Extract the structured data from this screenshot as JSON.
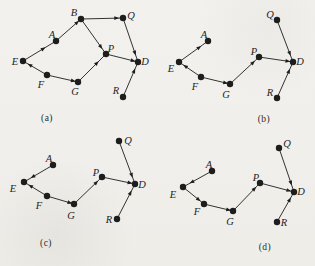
{
  "figure": {
    "background_color": "#f1f0ec",
    "ink_color": "#1d1d1d",
    "node_ids": [
      "A",
      "B",
      "D",
      "E",
      "F",
      "G",
      "P",
      "Q",
      "R"
    ],
    "panels": [
      {
        "id": "a",
        "caption": "(a)",
        "caption_x": 47,
        "caption_y": 121,
        "nodes": [
          {
            "id": "E",
            "x": 23,
            "y": 61,
            "label_x": 15,
            "label_y": 65
          },
          {
            "id": "A",
            "x": 56,
            "y": 41,
            "label_x": 52,
            "label_y": 38
          },
          {
            "id": "B",
            "x": 81,
            "y": 19,
            "label_x": 74,
            "label_y": 16
          },
          {
            "id": "Q",
            "x": 123,
            "y": 18,
            "label_x": 131,
            "label_y": 19
          },
          {
            "id": "P",
            "x": 106,
            "y": 54,
            "label_x": 111,
            "label_y": 52
          },
          {
            "id": "D",
            "x": 138,
            "y": 62,
            "label_x": 145,
            "label_y": 65
          },
          {
            "id": "F",
            "x": 47,
            "y": 75,
            "label_x": 41,
            "label_y": 88
          },
          {
            "id": "G",
            "x": 78,
            "y": 82,
            "label_x": 75,
            "label_y": 95
          },
          {
            "id": "R",
            "x": 123,
            "y": 97,
            "label_x": 116,
            "label_y": 94
          }
        ],
        "edges": [
          {
            "from": "E",
            "to": "A",
            "arrow_t": 0.62
          },
          {
            "from": "A",
            "to": "B",
            "arrow_t": 0.85
          },
          {
            "from": "B",
            "to": "Q",
            "arrow_t": 0.85
          },
          {
            "from": "B",
            "to": "P",
            "arrow_t": 0.8
          },
          {
            "from": "F",
            "to": "E",
            "arrow_t": 0.72
          },
          {
            "from": "F",
            "to": "G",
            "arrow_t": 0.85
          },
          {
            "from": "G",
            "to": "P",
            "arrow_t": 0.68
          },
          {
            "from": "P",
            "to": "D",
            "arrow_t": 0.85
          },
          {
            "from": "Q",
            "to": "D",
            "arrow_t": 0.8
          },
          {
            "from": "R",
            "to": "D",
            "arrow_t": 0.75
          }
        ]
      },
      {
        "id": "b",
        "caption": "(b)",
        "caption_x": 264,
        "caption_y": 122,
        "nodes": [
          {
            "id": "Q",
            "x": 277,
            "y": 20,
            "label_x": 270,
            "label_y": 18
          },
          {
            "id": "A",
            "x": 208,
            "y": 41,
            "label_x": 204,
            "label_y": 38
          },
          {
            "id": "E",
            "x": 179,
            "y": 62,
            "label_x": 171,
            "label_y": 72
          },
          {
            "id": "F",
            "x": 201,
            "y": 77,
            "label_x": 195,
            "label_y": 90
          },
          {
            "id": "G",
            "x": 230,
            "y": 84,
            "label_x": 226,
            "label_y": 98
          },
          {
            "id": "P",
            "x": 259,
            "y": 57,
            "label_x": 254,
            "label_y": 55
          },
          {
            "id": "D",
            "x": 293,
            "y": 62,
            "label_x": 300,
            "label_y": 65
          },
          {
            "id": "R",
            "x": 277,
            "y": 98,
            "label_x": 270,
            "label_y": 96
          }
        ],
        "edges": [
          {
            "from": "E",
            "to": "A",
            "arrow_t": 0.7
          },
          {
            "from": "F",
            "to": "E",
            "arrow_t": 0.72
          },
          {
            "from": "F",
            "to": "G",
            "arrow_t": 0.85
          },
          {
            "from": "G",
            "to": "P",
            "arrow_t": 0.8
          },
          {
            "from": "P",
            "to": "D",
            "arrow_t": 0.85
          },
          {
            "from": "Q",
            "to": "D",
            "arrow_t": 0.8
          },
          {
            "from": "R",
            "to": "D",
            "arrow_t": 0.75
          }
        ]
      },
      {
        "id": "c",
        "caption": "(c)",
        "caption_x": 46,
        "caption_y": 246,
        "nodes": [
          {
            "id": "Q",
            "x": 119,
            "y": 141,
            "label_x": 128,
            "label_y": 144
          },
          {
            "id": "A",
            "x": 53,
            "y": 165,
            "label_x": 49,
            "label_y": 162
          },
          {
            "id": "E",
            "x": 24,
            "y": 182,
            "label_x": 13,
            "label_y": 192
          },
          {
            "id": "F",
            "x": 47,
            "y": 196,
            "label_x": 39,
            "label_y": 209
          },
          {
            "id": "G",
            "x": 74,
            "y": 204,
            "label_x": 71,
            "label_y": 219
          },
          {
            "id": "P",
            "x": 102,
            "y": 177,
            "label_x": 96,
            "label_y": 176
          },
          {
            "id": "D",
            "x": 135,
            "y": 184,
            "label_x": 142,
            "label_y": 188
          },
          {
            "id": "R",
            "x": 117,
            "y": 219,
            "label_x": 109,
            "label_y": 223
          }
        ],
        "edges": [
          {
            "from": "A",
            "to": "E",
            "arrow_t": 0.7
          },
          {
            "from": "F",
            "to": "E",
            "arrow_t": 0.72
          },
          {
            "from": "F",
            "to": "G",
            "arrow_t": 0.85
          },
          {
            "from": "G",
            "to": "P",
            "arrow_t": 0.8
          },
          {
            "from": "P",
            "to": "D",
            "arrow_t": 0.85
          },
          {
            "from": "Q",
            "to": "D",
            "arrow_t": 0.8
          },
          {
            "from": "R",
            "to": "D",
            "arrow_t": 0.75
          }
        ]
      },
      {
        "id": "d",
        "caption": "(d)",
        "caption_x": 265,
        "caption_y": 250,
        "nodes": [
          {
            "id": "Q",
            "x": 279,
            "y": 148,
            "label_x": 287,
            "label_y": 147
          },
          {
            "id": "A",
            "x": 212,
            "y": 171,
            "label_x": 209,
            "label_y": 168
          },
          {
            "id": "E",
            "x": 183,
            "y": 187,
            "label_x": 173,
            "label_y": 198
          },
          {
            "id": "F",
            "x": 204,
            "y": 204,
            "label_x": 197,
            "label_y": 215
          },
          {
            "id": "G",
            "x": 233,
            "y": 211,
            "label_x": 230,
            "label_y": 225
          },
          {
            "id": "P",
            "x": 260,
            "y": 183,
            "label_x": 256,
            "label_y": 181
          },
          {
            "id": "D",
            "x": 294,
            "y": 192,
            "label_x": 301,
            "label_y": 195
          },
          {
            "id": "R",
            "x": 277,
            "y": 222,
            "label_x": 284,
            "label_y": 226
          }
        ],
        "edges": [
          {
            "from": "A",
            "to": "E",
            "arrow_t": 0.7
          },
          {
            "from": "E",
            "to": "F",
            "arrow_t": 0.75
          },
          {
            "from": "F",
            "to": "G",
            "arrow_t": 0.85
          },
          {
            "from": "G",
            "to": "P",
            "arrow_t": 0.8
          },
          {
            "from": "P",
            "to": "D",
            "arrow_t": 0.85
          },
          {
            "from": "Q",
            "to": "D",
            "arrow_t": 0.8
          },
          {
            "from": "R",
            "to": "D",
            "arrow_t": 0.75
          }
        ]
      }
    ],
    "style": {
      "node_radius": 3.2,
      "edge_width": 0.9,
      "arrow_len": 2.4,
      "arrow_halfwidth": 1.9
    }
  }
}
